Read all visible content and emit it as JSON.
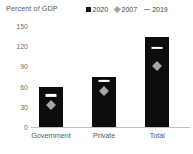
{
  "chart_data": {
    "type": "bar",
    "title": "Percent of GDP",
    "xlabel": "",
    "ylabel": "",
    "ylim": [
      0,
      150
    ],
    "yticks": [
      0,
      30,
      60,
      90,
      120,
      150
    ],
    "ytick_labels": [
      "0",
      "30",
      "60",
      "90",
      "120",
      "150"
    ],
    "grid": false,
    "legend_position": "top-right",
    "categories": [
      "Government",
      "Private",
      "Total"
    ],
    "series": [
      {
        "name": "2020",
        "marker": "bar-square",
        "color": "#0d0d0d",
        "values": [
          60,
          74,
          134
        ]
      },
      {
        "name": "2007",
        "marker": "diamond",
        "color": "#a6a6a6",
        "values": [
          33,
          53,
          91
        ]
      },
      {
        "name": "2019",
        "marker": "dash",
        "color": "#ffffff",
        "values": [
          47,
          68,
          117
        ]
      }
    ]
  },
  "legend": {
    "items": [
      {
        "label": "2020",
        "marker": "square-marker-icon"
      },
      {
        "label": "2007",
        "marker": "diamond-marker-icon"
      },
      {
        "label": "2019",
        "marker": "dash-marker-icon"
      }
    ]
  },
  "colors": {
    "bar": "#0d0d0d",
    "diamond": "#a6a6a6",
    "dash": "#ffffff",
    "axis": "#bfbfbf",
    "text": "#595959",
    "tick_text": "#6e6e6e"
  }
}
